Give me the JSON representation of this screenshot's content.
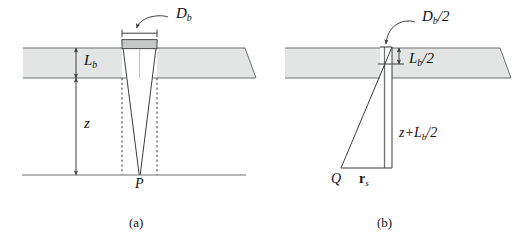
{
  "figure": {
    "background_color": "#ffffff",
    "line_color": "#3c3c3c",
    "slab_fill": "#e3e5e5",
    "slab_edge": "#8a8d8d",
    "box_fill": "#c6c8c8",
    "box_edge": "#4a4a4a",
    "panels": [
      {
        "id": "a",
        "caption": "(a)",
        "labels": {
          "diameter": {
            "base": "D",
            "sub": "b",
            "suffix": "",
            "text": "D_b"
          },
          "beam_length": {
            "base": "L",
            "sub": "b",
            "suffix": "",
            "text": "L_b"
          },
          "depth": {
            "base": "z",
            "sub": "",
            "suffix": "",
            "text": "z"
          },
          "point": {
            "base": "P",
            "sub": "",
            "suffix": "",
            "text": "P"
          }
        }
      },
      {
        "id": "b",
        "caption": "(b)",
        "labels": {
          "half_diameter": {
            "base": "D",
            "sub": "b",
            "suffix": "/2",
            "text": "D_b/2"
          },
          "half_beam_length": {
            "base": "L",
            "sub": "b",
            "suffix": "/2",
            "text": "L_b/2"
          },
          "slant_depth": {
            "prefix": "z+",
            "base": "L",
            "sub": "b",
            "suffix": "/2",
            "text": "z+L_b/2"
          },
          "source_point": {
            "base": "Q",
            "sub": "",
            "suffix": "",
            "text": "Q"
          },
          "source_vector": {
            "base": "r",
            "sub": "s",
            "suffix": "",
            "text": "r_s"
          }
        }
      }
    ]
  }
}
